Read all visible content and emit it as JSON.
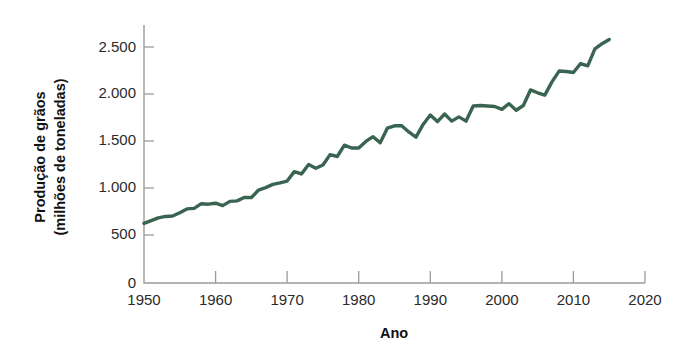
{
  "chart_data": {
    "type": "line",
    "title": "",
    "subtitle": "",
    "xlabel": "Ano",
    "ylabel": "Produção de grãos\n(milhões de toneladas)",
    "ylabel_line1": "Produção de grãos",
    "ylabel_line2": "(milhões de toneladas)",
    "xlim": [
      1950,
      2020
    ],
    "ylim": [
      0,
      2700
    ],
    "xticks": [
      1950,
      1960,
      1970,
      1980,
      1990,
      2000,
      2010,
      2020
    ],
    "xticklabels": [
      "1950",
      "1960",
      "1970",
      "1980",
      "1990",
      "2000",
      "2010",
      "2020"
    ],
    "yticks": [
      0,
      500,
      1000,
      1500,
      2000,
      2500
    ],
    "yticklabels": [
      "0",
      "500",
      "1.000",
      "1.500",
      "2.000",
      "2.500"
    ],
    "grid": false,
    "legend": false,
    "legend_position": "none",
    "line_color": "#3A6452",
    "series": [
      {
        "name": "Produção mundial de grãos",
        "x": [
          1950,
          1951,
          1952,
          1953,
          1954,
          1955,
          1956,
          1957,
          1958,
          1959,
          1960,
          1961,
          1962,
          1963,
          1964,
          1965,
          1966,
          1967,
          1968,
          1969,
          1970,
          1971,
          1972,
          1973,
          1974,
          1975,
          1976,
          1977,
          1978,
          1979,
          1980,
          1981,
          1982,
          1983,
          1984,
          1985,
          1986,
          1987,
          1988,
          1989,
          1990,
          1991,
          1992,
          1993,
          1994,
          1995,
          1996,
          1997,
          1998,
          1999,
          2000,
          2001,
          2002,
          2003,
          2004,
          2005,
          2006,
          2007,
          2008,
          2009,
          2010,
          2011,
          2012,
          2013,
          2014,
          2015
        ],
        "values": [
          631,
          660,
          690,
          705,
          710,
          745,
          785,
          790,
          840,
          835,
          845,
          820,
          865,
          870,
          905,
          905,
          985,
          1010,
          1045,
          1060,
          1080,
          1180,
          1155,
          1255,
          1215,
          1250,
          1360,
          1340,
          1460,
          1430,
          1430,
          1500,
          1550,
          1485,
          1640,
          1665,
          1665,
          1600,
          1545,
          1680,
          1780,
          1710,
          1790,
          1715,
          1760,
          1715,
          1875,
          1880,
          1875,
          1870,
          1840,
          1900,
          1830,
          1880,
          2045,
          2015,
          1990,
          2130,
          2245,
          2240,
          2230,
          2325,
          2300,
          2480,
          2535,
          2580
        ],
        "units": "milhões de toneladas",
        "start_value": 631,
        "end_value": 2580,
        "min_value": 631,
        "max_value": 2580
      }
    ]
  },
  "axis": {
    "x_title": "Ano",
    "y_title_line1": "Produção de grãos",
    "y_title_line2": "(milhões de toneladas)"
  }
}
